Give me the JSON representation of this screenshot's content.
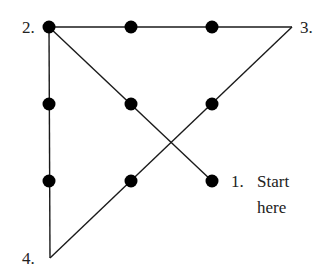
{
  "colors": {
    "line": "#1a1a1a",
    "dot": "#000000",
    "text": "#222222",
    "background": "#ffffff"
  },
  "dots": [
    {
      "row": 1,
      "col": 1,
      "x": 49,
      "y": 27
    },
    {
      "row": 1,
      "col": 2,
      "x": 131,
      "y": 27
    },
    {
      "row": 1,
      "col": 3,
      "x": 212,
      "y": 27
    },
    {
      "row": 2,
      "col": 1,
      "x": 49,
      "y": 104
    },
    {
      "row": 2,
      "col": 2,
      "x": 131,
      "y": 104
    },
    {
      "row": 2,
      "col": 3,
      "x": 212,
      "y": 104
    },
    {
      "row": 3,
      "col": 1,
      "x": 49,
      "y": 181
    },
    {
      "row": 3,
      "col": 2,
      "x": 131,
      "y": 181
    },
    {
      "row": 3,
      "col": 3,
      "x": 212,
      "y": 181
    }
  ],
  "path_points": [
    {
      "step": "1",
      "x": 212,
      "y": 181
    },
    {
      "step": "2",
      "x": 49,
      "y": 27
    },
    {
      "step": "3",
      "x": 292,
      "y": 27
    },
    {
      "step": "4",
      "x": 50,
      "y": 258
    }
  ],
  "labels": {
    "p1_num": "1.",
    "p1_line1": "Start",
    "p1_line2": "here",
    "p2": "2.",
    "p3": "3.",
    "p4": "4."
  }
}
